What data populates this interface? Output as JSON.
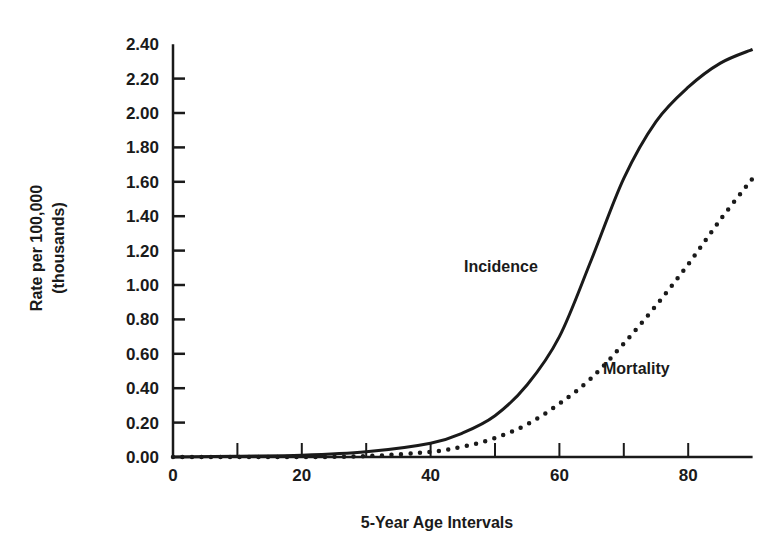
{
  "chart_data": {
    "type": "line",
    "title": "",
    "xlabel": "5-Year Age Intervals",
    "ylabel": "Rate per 100,000",
    "ylabel_sub": "(thousands)",
    "xlim": [
      0,
      90
    ],
    "ylim": [
      0,
      2.4
    ],
    "grid": false,
    "legend": "inline labels",
    "x_ticks": [
      0,
      10,
      20,
      30,
      40,
      50,
      60,
      70,
      80
    ],
    "x_tick_labels": [
      "0",
      "20",
      "40",
      "60",
      "80"
    ],
    "x_tick_label_values": [
      0,
      20,
      40,
      60,
      80
    ],
    "y_ticks": [
      0,
      0.2,
      0.4,
      0.6,
      0.8,
      1.0,
      1.2,
      1.4,
      1.6,
      1.8,
      2.0,
      2.2,
      2.4
    ],
    "y_tick_labels": [
      "0.00",
      "0.20",
      "0.40",
      "0.60",
      "0.80",
      "1.00",
      "1.20",
      "1.40",
      "1.60",
      "1.80",
      "2.00",
      "2.20",
      "2.40"
    ],
    "x": [
      0,
      10,
      20,
      30,
      40,
      45,
      50,
      55,
      60,
      65,
      70,
      75,
      80,
      85,
      90
    ],
    "series": [
      {
        "name": "Incidence",
        "style": "solid",
        "values": [
          0.0,
          0.005,
          0.01,
          0.03,
          0.08,
          0.14,
          0.24,
          0.42,
          0.7,
          1.15,
          1.62,
          1.95,
          2.15,
          2.29,
          2.37
        ]
      },
      {
        "name": "Mortality",
        "style": "dotted",
        "values": [
          0.0,
          0.0,
          0.0,
          0.005,
          0.03,
          0.06,
          0.11,
          0.19,
          0.31,
          0.46,
          0.66,
          0.88,
          1.12,
          1.38,
          1.62
        ]
      }
    ],
    "annotations": [
      {
        "text": "Incidence",
        "near": "solid curve at ~age 62"
      },
      {
        "text": "Mortality",
        "near": "dotted curve at ~age 68"
      }
    ]
  },
  "labels": {
    "incidence": "Incidence",
    "mortality": "Mortality",
    "xlabel": "5-Year Age Intervals",
    "ylabel_line1": "Rate per 100,000",
    "ylabel_line2": "(thousands)"
  },
  "style": {
    "ink": "#1a1a1a",
    "background": "#ffffff"
  }
}
